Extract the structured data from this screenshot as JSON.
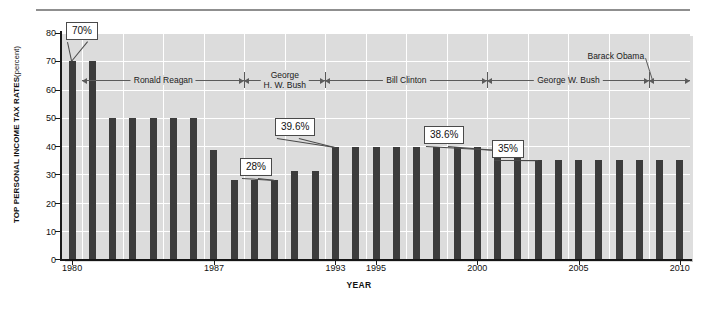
{
  "chart_data": {
    "type": "bar",
    "title": "",
    "xlabel": "YEAR",
    "ylabel": "TOP PERSONAL INCOME TAX RATES (percent)",
    "ylabel_main": "TOP PERSONAL INCOME TAX RATES",
    "ylabel_unit": "(percent)",
    "ylim": [
      0,
      80
    ],
    "ytick_labels": [
      "0",
      "10",
      "20",
      "30",
      "40",
      "50",
      "60",
      "70",
      "80"
    ],
    "ytick_values": [
      0,
      10,
      20,
      30,
      40,
      50,
      60,
      70,
      80
    ],
    "xtick_labels": [
      "1980",
      "1987",
      "1993",
      "1995",
      "2000",
      "2005",
      "2010"
    ],
    "xtick_values": [
      1980,
      1987,
      1993,
      1995,
      2000,
      2005,
      2010
    ],
    "grid": true,
    "legend": "none",
    "bar_color": "#3c3c3c",
    "plot_background": "#dcdcdc",
    "categories": [
      1980,
      1981,
      1982,
      1983,
      1984,
      1985,
      1986,
      1987,
      1988,
      1989,
      1990,
      1991,
      1992,
      1993,
      1994,
      1995,
      1996,
      1997,
      1998,
      1999,
      2000,
      2001,
      2002,
      2003,
      2004,
      2005,
      2006,
      2007,
      2008,
      2009,
      2010
    ],
    "values": [
      70,
      70,
      50,
      50,
      50,
      50,
      50,
      38.5,
      28,
      28,
      28,
      31,
      31,
      39.6,
      39.6,
      39.6,
      39.6,
      39.6,
      39.6,
      39.6,
      39.6,
      38.6,
      38.6,
      35,
      35,
      35,
      35,
      35,
      35,
      35,
      35
    ],
    "annotations": [
      {
        "label": "70%",
        "year": 1980
      },
      {
        "label": "28%",
        "year": 1990
      },
      {
        "label": "39.6%",
        "year": 1993
      },
      {
        "label": "38.6%",
        "year": 2001
      },
      {
        "label": "35%",
        "year": 2003
      }
    ],
    "presidency_bands": [
      {
        "name": "Ronald Reagan",
        "start": 1981,
        "end": 1989
      },
      {
        "name": "George\nH. W. Bush",
        "start": 1989,
        "end": 1993
      },
      {
        "name": "Bill Clinton",
        "start": 1993,
        "end": 2001
      },
      {
        "name": "George W. Bush",
        "start": 2001,
        "end": 2009
      },
      {
        "name": "Barack Obama",
        "start": 2009,
        "end": 2011
      }
    ]
  },
  "axis": {
    "ytitle_main": "TOP PERSONAL INCOME TAX RATES",
    "ytitle_unit": "(percent)",
    "xtitle": "YEAR"
  },
  "ylabels": {
    "v0": "0",
    "v10": "10",
    "v20": "20",
    "v30": "30",
    "v40": "40",
    "v50": "50",
    "v60": "60",
    "v70": "70",
    "v80": "80"
  },
  "xlabels": {
    "t1980": "1980",
    "t1987": "1987",
    "t1993": "1993",
    "t1995": "1995",
    "t2000": "2000",
    "t2005": "2005",
    "t2010": "2010"
  },
  "presidents": {
    "reagan": "Ronald Reagan",
    "hwbush_line1": "George",
    "hwbush_line2": "H. W. Bush",
    "clinton": "Bill Clinton",
    "gwbush": "George W. Bush",
    "obama": "Barack Obama"
  },
  "callouts": {
    "c70": "70%",
    "c28": "28%",
    "c396": "39.6%",
    "c386": "38.6%",
    "c35": "35%"
  },
  "colors": {
    "bar": "#3c3c3c",
    "plot_bg": "#dcdcdc",
    "grid": "#ffffff",
    "axis": "#1a1a1a",
    "callout_border": "#4a4a4a",
    "band_line": "#5b5b5b"
  }
}
